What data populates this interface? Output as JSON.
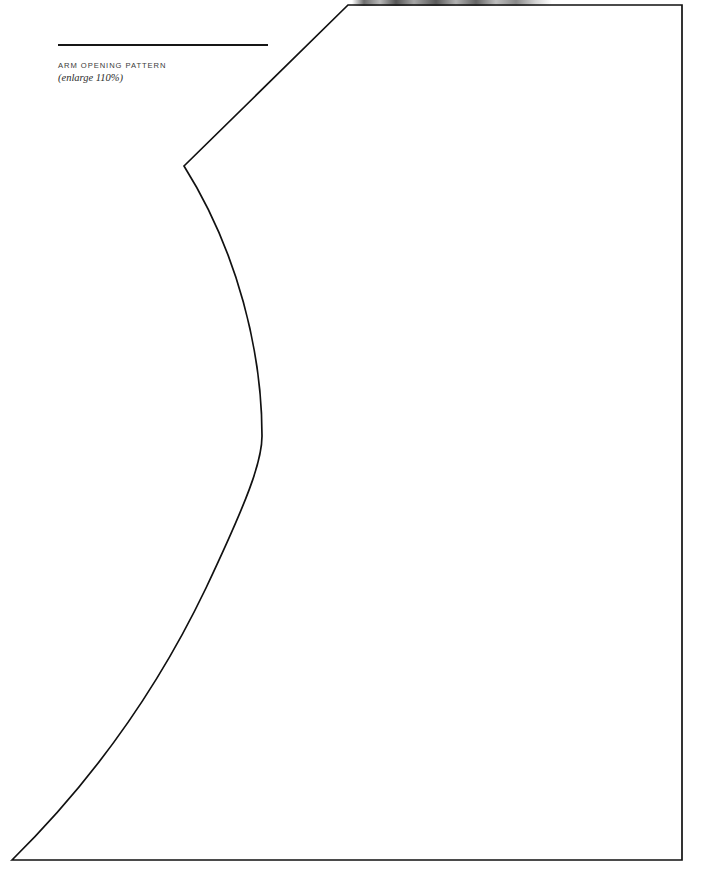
{
  "page": {
    "width": 704,
    "height": 873,
    "background_color": "#ffffff",
    "ink_color": "#111111"
  },
  "caption": {
    "title": "ARM OPENING PATTERN",
    "note": "(enlarge 110%)",
    "rule_color": "#161616"
  },
  "pattern": {
    "name": "arm-opening-pattern",
    "stroke_color": "#111111",
    "stroke_width": 1.7,
    "fill": "none",
    "path": "M 184 166 L 348 5 L 682 5 L 682 860 L 12 860 C 78 795 150 705 206 588 C 247 501 262 462 262 436 C 262 352 238 252 184 166 Z",
    "vertices": [
      {
        "name": "left-apex",
        "x": 184,
        "y": 166
      },
      {
        "name": "shoulder-top-left",
        "x": 348,
        "y": 5
      },
      {
        "name": "top-right-corner",
        "x": 682,
        "y": 5
      },
      {
        "name": "bottom-right-corner",
        "x": 682,
        "y": 860
      },
      {
        "name": "bottom-left-point",
        "x": 12,
        "y": 860
      }
    ],
    "curve_max_bulge": {
      "x": 262,
      "y": 440
    }
  },
  "artifact": {
    "name": "scan-smudge",
    "x": 352,
    "y": 0,
    "width": 200,
    "height": 6
  }
}
